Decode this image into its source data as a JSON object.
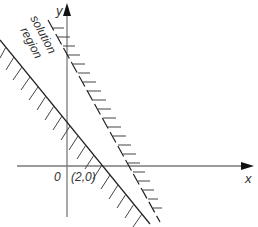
{
  "diagram": {
    "axes": {
      "x_label": "x",
      "y_label": "y",
      "origin_label": "0",
      "color": "#7a7a7a"
    },
    "point_label": "(2,0)",
    "region_label_line1": "solution",
    "region_label_line2": "region",
    "line_color": "#222222",
    "hatch_color": "#444444"
  }
}
